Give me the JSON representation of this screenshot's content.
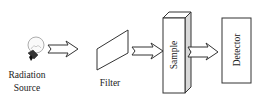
{
  "diagram": {
    "type": "flow",
    "labels": {
      "source_line1": "Radiation",
      "source_line2": "Source",
      "filter": "Filter",
      "sample": "Sample",
      "detector": "Detector"
    },
    "flow": [
      "Radiation Source",
      "Filter",
      "Sample",
      "Detector"
    ],
    "colors": {
      "stroke": "#333333",
      "background": "#ffffff",
      "sample_side": "#d9d9d9"
    }
  }
}
